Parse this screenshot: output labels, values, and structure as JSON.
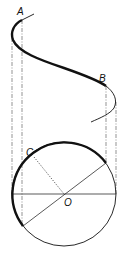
{
  "diagram": {
    "type": "projection of circle onto sinusoid",
    "labels": {
      "A": "A",
      "B": "B",
      "C": "C",
      "O": "O"
    },
    "colors": {
      "stroke": "#111111",
      "guide": "#555555",
      "background": "#ffffff"
    }
  }
}
